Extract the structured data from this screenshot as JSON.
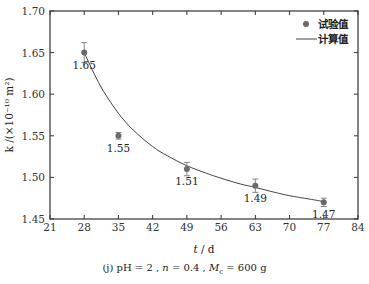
{
  "chart_data": {
    "type": "scatter",
    "title": "",
    "xlabel": "t / d",
    "ylabel": "k /(×10^-10 m^2)",
    "xlim": [
      21,
      84
    ],
    "ylim": [
      1.45,
      1.7
    ],
    "x_ticks": [
      21,
      28,
      35,
      42,
      49,
      56,
      63,
      70,
      77,
      84
    ],
    "y_ticks": [
      1.45,
      1.5,
      1.55,
      1.6,
      1.65,
      1.7
    ],
    "grid": false,
    "legend_position": "upper right",
    "series": [
      {
        "name": "试验值",
        "kind": "scatter_with_errorbars",
        "x": [
          28,
          35,
          49,
          63,
          77
        ],
        "values": [
          1.65,
          1.55,
          1.51,
          1.49,
          1.47
        ],
        "error": [
          0.012,
          0.004,
          0.008,
          0.008,
          0.005
        ],
        "data_labels": [
          "1.65",
          "1.55",
          "1.51",
          "1.49",
          "1.47"
        ]
      },
      {
        "name": "计算值",
        "kind": "line",
        "x": [
          28,
          30,
          32,
          35,
          38,
          42,
          45,
          49,
          53,
          56,
          60,
          63,
          67,
          70,
          74,
          77
        ],
        "values": [
          1.65,
          1.625,
          1.603,
          1.577,
          1.557,
          1.537,
          1.526,
          1.514,
          1.505,
          1.499,
          1.492,
          1.488,
          1.482,
          1.478,
          1.474,
          1.471
        ]
      }
    ],
    "caption": "(j) pH=2, n=0.4, Mc=600 g"
  },
  "axes": {
    "x_title_var": "t",
    "x_title_unit": " / d",
    "y_title": "k /(×10⁻¹⁰ m²)"
  },
  "legend": {
    "items": [
      {
        "label": "试验值",
        "marker": "dot"
      },
      {
        "label": "计算值",
        "marker": "line"
      }
    ]
  },
  "caption": {
    "prefix": "(j)  pH = 2 , ",
    "n_var": "n",
    "n_val": " = 0.4 , ",
    "m_var": "M",
    "m_sub": "c",
    "m_val": " = 600 g"
  },
  "colors": {
    "marker": "#6a6a6a",
    "line": "#444444",
    "axis": "#333333"
  }
}
